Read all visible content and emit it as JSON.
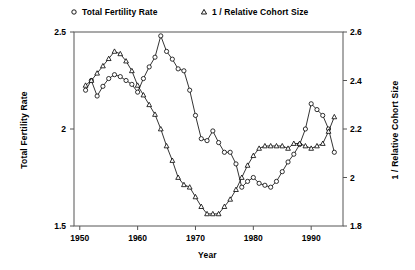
{
  "chart_data": {
    "type": "line",
    "title": "",
    "xlabel": "Year",
    "ylabel": "Total Fertility Rate",
    "ylabel_right": "1 / Relative Cohort Size",
    "xlim": [
      1949,
      1995.5
    ],
    "ylim": [
      1.5,
      2.5
    ],
    "ylim_right": [
      1.8,
      2.6
    ],
    "xticks": [
      1950,
      1960,
      1970,
      1980,
      1990
    ],
    "xticklabels": [
      "1950",
      "1960",
      "1970",
      "1980",
      "1990"
    ],
    "yticks": [
      1.5,
      2,
      2.5
    ],
    "yticklabels": [
      "1.5",
      "2",
      "2.5"
    ],
    "yticks_right": [
      1.8,
      2,
      2.2,
      2.4,
      2.6
    ],
    "yticklabels_right": [
      "1.8",
      "2",
      "2.2",
      "2.4",
      "2.6"
    ],
    "grid": false,
    "legend_position": "top",
    "legend": [
      "Total Fertility Rate",
      "1 / Relative Cohort Size"
    ],
    "series": [
      {
        "name": "Total Fertility Rate",
        "marker": "circle",
        "axis": "left",
        "x": [
          1951,
          1952,
          1953,
          1954,
          1955,
          1956,
          1957,
          1958,
          1959,
          1960,
          1961,
          1962,
          1963,
          1964,
          1965,
          1966,
          1967,
          1968,
          1969,
          1970,
          1971,
          1972,
          1973,
          1974,
          1975,
          1976,
          1977,
          1978,
          1979,
          1980,
          1981,
          1982,
          1983,
          1984,
          1985,
          1986,
          1987,
          1988,
          1989,
          1990,
          1991,
          1992,
          1993,
          1994
        ],
        "y": [
          2.2,
          2.25,
          2.17,
          2.22,
          2.26,
          2.28,
          2.27,
          2.25,
          2.23,
          2.19,
          2.26,
          2.32,
          2.37,
          2.48,
          2.4,
          2.36,
          2.31,
          2.3,
          2.2,
          2.07,
          1.95,
          1.94,
          1.99,
          1.93,
          1.88,
          1.88,
          1.82,
          1.7,
          1.73,
          1.75,
          1.72,
          1.71,
          1.7,
          1.73,
          1.78,
          1.83,
          1.87,
          1.92,
          2.0,
          2.13,
          2.1,
          2.07,
          2.0,
          1.88
        ]
      },
      {
        "name": "1 / Relative Cohort Size",
        "marker": "triangle",
        "axis": "right",
        "x": [
          1951,
          1952,
          1953,
          1954,
          1955,
          1956,
          1957,
          1958,
          1959,
          1960,
          1961,
          1962,
          1963,
          1964,
          1965,
          1966,
          1967,
          1968,
          1969,
          1970,
          1971,
          1972,
          1973,
          1974,
          1975,
          1976,
          1977,
          1978,
          1979,
          1980,
          1981,
          1982,
          1983,
          1984,
          1985,
          1986,
          1987,
          1988,
          1989,
          1990,
          1991,
          1992,
          1993,
          1994
        ],
        "y": [
          2.38,
          2.4,
          2.43,
          2.46,
          2.49,
          2.52,
          2.51,
          2.48,
          2.44,
          2.38,
          2.34,
          2.3,
          2.26,
          2.2,
          2.13,
          2.07,
          2.0,
          1.97,
          1.96,
          1.92,
          1.88,
          1.85,
          1.85,
          1.85,
          1.88,
          1.91,
          1.95,
          2.0,
          2.05,
          2.09,
          2.12,
          2.13,
          2.13,
          2.13,
          2.13,
          2.12,
          2.14,
          2.14,
          2.13,
          2.12,
          2.13,
          2.14,
          2.19,
          2.25
        ]
      }
    ]
  },
  "legend": {
    "tfr_label": "Total Fertility Rate",
    "rcs_label": "1 / Relative Cohort Size",
    "tfr_marker": "circle-marker-icon",
    "rcs_marker": "triangle-marker-icon"
  },
  "axes": {
    "x_title": "Year",
    "y_left_title": "Total Fertility Rate",
    "y_right_title": "1 / Relative Cohort Size"
  },
  "colors": {
    "line": "#000000",
    "frame": "#555555",
    "background": "#ffffff"
  }
}
